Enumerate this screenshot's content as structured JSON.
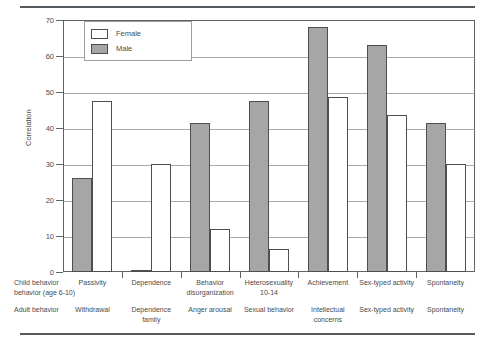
{
  "chart_data": {
    "type": "bar",
    "title": "",
    "xlabel": "",
    "ylabel": "Correlation",
    "ylim": [
      0,
      70
    ],
    "yticks": [
      0,
      10,
      20,
      30,
      40,
      50,
      60,
      70
    ],
    "grid": true,
    "legend_position": "top-left",
    "categories": [
      "Passivity",
      "Dependence",
      "Behavior disorganization",
      "Heterosexuality 10-14",
      "Achievement",
      "Sex-typed activity",
      "Spontaneity"
    ],
    "series": [
      {
        "name": "Male",
        "values": [
          26,
          0.5,
          41.5,
          47.5,
          68,
          63,
          41.5
        ]
      },
      {
        "name": "Female",
        "values": [
          47.5,
          30,
          12,
          6.5,
          48.5,
          43.5,
          30
        ]
      }
    ]
  },
  "legend": {
    "female_label": "Female",
    "male_label": "Male"
  },
  "axes": {
    "y_title": "Correlation",
    "y_tick_70": "70",
    "y_tick_60": "60",
    "y_tick_50": "50",
    "y_tick_40": "40",
    "y_tick_30": "30",
    "y_tick_20": "20",
    "y_tick_10": "10",
    "y_tick_0": "0"
  },
  "rows": {
    "child_row_title": "Child behavior\nbehavior (age 6-10)",
    "adult_row_title": "Adult behavior",
    "child_labels": [
      "Passivity",
      "Dependence",
      "Behavior\ndisorganization",
      "Heterosexuality\n10-14",
      "Achievement",
      "Sex-typed activity",
      "Spontaneity"
    ],
    "adult_labels": [
      "Withdrawal",
      "Dependence\nfamily",
      "Anger arousal",
      "Sexual behavior",
      "Intellectual\nconcerns",
      "Sex-typed activity",
      "Spontaneity"
    ]
  },
  "colors": {
    "male_fill": "#a6a6a6",
    "female_fill": "#ffffff",
    "bar_stroke": "#4a4f52",
    "gridline": "#a8acae",
    "rule": "#555a5e"
  }
}
